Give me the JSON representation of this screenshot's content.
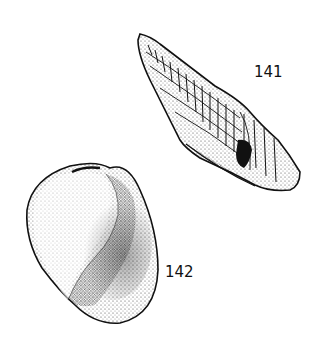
{
  "illustration": {
    "figures": [
      {
        "id": "141",
        "label": "141",
        "subject": "high-spired turret shell with axial ribs and spiral cords"
      },
      {
        "id": "142",
        "label": "142",
        "subject": "rounded globular shell shown in stippled shading"
      }
    ],
    "colors": {
      "ink": "#111111",
      "paper": "#ffffff"
    }
  }
}
